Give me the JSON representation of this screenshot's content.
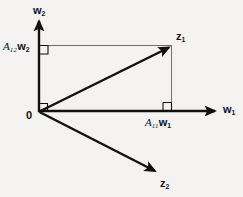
{
  "figure": {
    "name": "vector-decomposition-diagram",
    "background_color": "#f4f3f1",
    "stroke_color": "#111111",
    "axes": {
      "horizontal_label": "w",
      "horizontal_label_sub": "1",
      "vertical_label": "w",
      "vertical_label_sub": "2"
    },
    "origin_label": "0",
    "vectors": [
      {
        "name": "z1",
        "label": "z",
        "label_sub": "1",
        "from": [
          39,
          112
        ],
        "to": [
          172,
          46
        ]
      },
      {
        "name": "z2",
        "label": "z",
        "label_sub": "2",
        "from": [
          39,
          112
        ],
        "to": [
          158,
          173
        ]
      }
    ],
    "components": [
      {
        "name": "a12w2",
        "matrix": "A",
        "matrix_sub": "12",
        "vector": "w",
        "vector_sub": "2",
        "axis": "vertical",
        "value_position": [
          39,
          46
        ]
      },
      {
        "name": "a11w1",
        "matrix": "A",
        "matrix_sub": "11",
        "vector": "w",
        "vector_sub": "1",
        "axis": "horizontal",
        "value_position": [
          172,
          111
        ]
      }
    ],
    "right_angle_markers": [
      {
        "name": "right-angle-origin",
        "at": [
          39,
          112
        ]
      },
      {
        "name": "right-angle-vertical-projection",
        "at": [
          39,
          46
        ]
      },
      {
        "name": "right-angle-horizontal-projection",
        "at": [
          172,
          111
        ]
      }
    ],
    "geometry": {
      "origin": [
        39,
        112
      ],
      "x_axis_end": [
        218,
        111
      ],
      "y_axis_end": [
        39,
        18
      ],
      "z1_point": [
        172,
        46
      ],
      "projection_line_color": "#6b6b6b"
    }
  }
}
